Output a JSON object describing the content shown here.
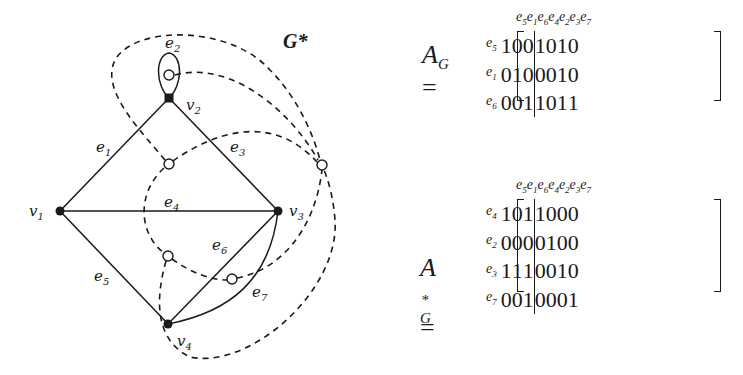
{
  "graph": {
    "title": "G*",
    "vertices": [
      {
        "id": "v1",
        "label": "v",
        "sub": "1",
        "x": 60,
        "y": 211
      },
      {
        "id": "v2",
        "label": "v",
        "sub": "2",
        "x": 169,
        "y": 98
      },
      {
        "id": "v3",
        "label": "v",
        "sub": "3",
        "x": 278,
        "y": 211
      },
      {
        "id": "v4",
        "label": "v",
        "sub": "4",
        "x": 168,
        "y": 324
      }
    ],
    "edges": [
      {
        "id": "e1",
        "label": "e",
        "sub": "1",
        "from": "v1",
        "to": "v2"
      },
      {
        "id": "e2",
        "label": "e",
        "sub": "2",
        "from": "v2",
        "to": "v2",
        "type": "loop"
      },
      {
        "id": "e3",
        "label": "e",
        "sub": "3",
        "from": "v2",
        "to": "v3"
      },
      {
        "id": "e4",
        "label": "e",
        "sub": "4",
        "from": "v1",
        "to": "v3"
      },
      {
        "id": "e5",
        "label": "e",
        "sub": "5",
        "from": "v1",
        "to": "v4"
      },
      {
        "id": "e6",
        "label": "e",
        "sub": "6",
        "from": "v4",
        "to": "v3"
      },
      {
        "id": "e7",
        "label": "e",
        "sub": "7",
        "from": "v4",
        "to": "v3",
        "type": "curved"
      }
    ],
    "dual_vertices": [
      {
        "id": "f_loop",
        "x": 169,
        "y": 75
      },
      {
        "id": "f_top",
        "x": 169,
        "y": 164
      },
      {
        "id": "f_outer",
        "x": 322,
        "y": 165
      },
      {
        "id": "f_bottom",
        "x": 168,
        "y": 256
      },
      {
        "id": "f_e67",
        "x": 232,
        "y": 279
      }
    ]
  },
  "matrix_AG": {
    "name": "A",
    "sub": "G",
    "equals": "=",
    "col_headers": [
      {
        "l": "e",
        "s": "5"
      },
      {
        "l": "e",
        "s": "1"
      },
      {
        "l": "e",
        "s": "6"
      },
      {
        "l": "e",
        "s": "4"
      },
      {
        "l": "e",
        "s": "2"
      },
      {
        "l": "e",
        "s": "3"
      },
      {
        "l": "e",
        "s": "7"
      }
    ],
    "row_headers": [
      {
        "l": "e",
        "s": "5"
      },
      {
        "l": "e",
        "s": "1"
      },
      {
        "l": "e",
        "s": "6"
      }
    ],
    "rows": [
      [
        "1",
        "0",
        "0",
        "1",
        "0",
        "1",
        "0"
      ],
      [
        "0",
        "1",
        "0",
        "0",
        "0",
        "1",
        "0"
      ],
      [
        "0",
        "0",
        "1",
        "1",
        "0",
        "1",
        "1"
      ]
    ]
  },
  "matrix_AGstar": {
    "name": "A",
    "sup": "*",
    "sub": "G",
    "equals": "=",
    "col_headers": [
      {
        "l": "e",
        "s": "5"
      },
      {
        "l": "e",
        "s": "1"
      },
      {
        "l": "e",
        "s": "6"
      },
      {
        "l": "e",
        "s": "4"
      },
      {
        "l": "e",
        "s": "2"
      },
      {
        "l": "e",
        "s": "3"
      },
      {
        "l": "e",
        "s": "7"
      }
    ],
    "row_headers": [
      {
        "l": "e",
        "s": "4"
      },
      {
        "l": "e",
        "s": "2"
      },
      {
        "l": "e",
        "s": "3"
      },
      {
        "l": "e",
        "s": "7"
      }
    ],
    "rows": [
      [
        "1",
        "0",
        "1",
        "1",
        "0",
        "0",
        "0"
      ],
      [
        "0",
        "0",
        "0",
        "0",
        "1",
        "0",
        "0"
      ],
      [
        "1",
        "1",
        "1",
        "0",
        "0",
        "1",
        "0"
      ],
      [
        "0",
        "0",
        "1",
        "0",
        "0",
        "0",
        "1"
      ]
    ]
  }
}
